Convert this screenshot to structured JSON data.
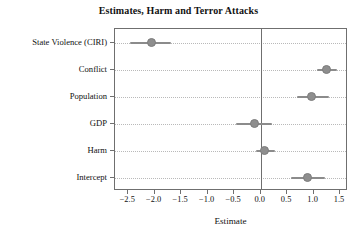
{
  "chart_data": {
    "type": "scatter",
    "subtype": "coefficient-dot-plot",
    "title": "Estimates, Harm and Terror Attacks",
    "xlabel": "Estimate",
    "ylabel": "",
    "grid": "horizontal-dotted",
    "legend": "none",
    "xlim": [
      -2.75,
      1.65
    ],
    "reference_line": 0.0,
    "xticks": [
      -2.5,
      -2.0,
      -1.5,
      -1.0,
      -0.5,
      0.0,
      0.5,
      1.0,
      1.5
    ],
    "xticklabels": [
      "−2.5",
      "−2.0",
      "−1.5",
      "−1.0",
      "−0.5",
      "0.0",
      "0.5",
      "1.0",
      "1.5"
    ],
    "categories": [
      "State Violence (CIRI)",
      "Conflict",
      "Population",
      "GDP",
      "Harm",
      "Intercept"
    ],
    "points": [
      {
        "term": "State Violence (CIRI)",
        "estimate": -2.06,
        "low": -2.47,
        "high": -1.7
      },
      {
        "term": "Conflict",
        "estimate": 1.24,
        "low": 1.06,
        "high": 1.45
      },
      {
        "term": "Population",
        "estimate": 0.97,
        "low": 0.69,
        "high": 1.3
      },
      {
        "term": "GDP",
        "estimate": -0.11,
        "low": -0.46,
        "high": 0.21
      },
      {
        "term": "Harm",
        "estimate": 0.08,
        "low": -0.08,
        "high": 0.27
      },
      {
        "term": "Intercept",
        "estimate": 0.89,
        "low": 0.58,
        "high": 1.21
      }
    ],
    "colors": {
      "point": "#8e8e8e",
      "error_bar": "#8b8b8b",
      "axis": "#6f6f6f",
      "gridline": "#b9b9b9",
      "text": "#111111",
      "background": "#ffffff"
    }
  }
}
